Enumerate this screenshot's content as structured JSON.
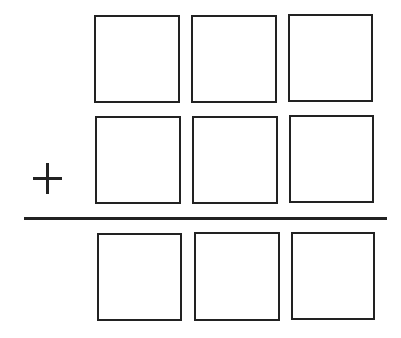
{
  "diagram": {
    "type": "vertical-addition-template",
    "operator": "+",
    "rows": [
      {
        "name": "addend-1",
        "boxes": [
          "",
          "",
          ""
        ]
      },
      {
        "name": "addend-2",
        "boxes": [
          "",
          "",
          ""
        ]
      },
      {
        "name": "sum",
        "boxes": [
          "",
          "",
          ""
        ]
      }
    ],
    "colors": {
      "stroke": "#222222",
      "background": "#ffffff"
    }
  }
}
